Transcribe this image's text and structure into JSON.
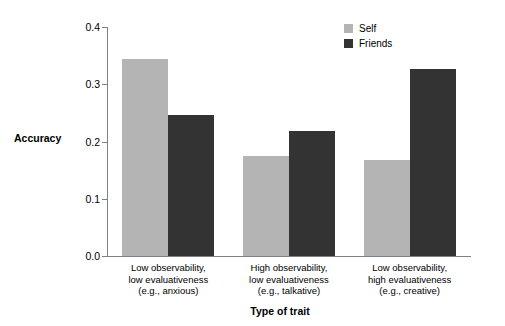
{
  "chart_data": {
    "type": "bar",
    "title": "",
    "xlabel": "Type of trait",
    "ylabel": "Accuracy",
    "ylim": [
      0.0,
      0.4
    ],
    "yticks": [
      "0.0",
      "0.1",
      "0.2",
      "0.3",
      "0.4"
    ],
    "ytick_values": [
      0.0,
      0.1,
      0.2,
      0.3,
      0.4
    ],
    "grid": false,
    "legend_position": "top-right",
    "categories": [
      "Low observability, low evaluativeness (e.g., anxious)",
      "High observability, low evaluativeness (e.g., talkative)",
      "Low observability, high evaluativeness (e.g., creative)"
    ],
    "category_lines": [
      [
        "Low observability,",
        "low evaluativeness",
        "(e.g., anxious)"
      ],
      [
        "High observability,",
        "low evaluativeness",
        "(e.g., talkative)"
      ],
      [
        "Low observability,",
        "high evaluativeness",
        "(e.g., creative)"
      ]
    ],
    "series": [
      {
        "name": "Self",
        "color": "#b4b4b4",
        "values": [
          0.345,
          0.175,
          0.168
        ]
      },
      {
        "name": "Friends",
        "color": "#333333",
        "values": [
          0.247,
          0.218,
          0.327
        ]
      }
    ]
  },
  "legend": {
    "items": [
      {
        "label": "Self",
        "color": "#b4b4b4"
      },
      {
        "label": "Friends",
        "color": "#333333"
      }
    ]
  },
  "axes": {
    "y_title": "Accuracy",
    "x_title": "Type of trait"
  },
  "colors": {
    "axis": "#808080",
    "text": "#000000",
    "background": "#ffffff",
    "self_bar": "#b4b4b4",
    "friends_bar": "#333333"
  }
}
